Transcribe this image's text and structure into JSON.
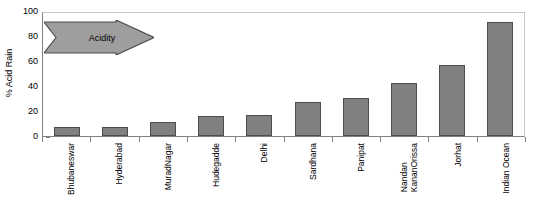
{
  "chart_data": {
    "type": "bar",
    "title": "",
    "xlabel": "",
    "ylabel": "% Acid Rain",
    "ylim": [
      0,
      100
    ],
    "yticks": [
      0,
      20,
      40,
      60,
      80,
      100
    ],
    "grid": false,
    "legend": null,
    "bar_color": "#808080",
    "bar_border_color": "#4d4d4d",
    "categories": [
      "Bhubaneswar",
      "Hyderabad",
      "MuradNagar",
      "Hudegadde",
      "Delhi",
      "Sardhana",
      "Panipat",
      "Nandan KananOrissa",
      "Jorhat",
      "Indian Ocean"
    ],
    "category_lines": [
      [
        "Bhubaneswar"
      ],
      [
        "Hyderabad"
      ],
      [
        "MuradNagar"
      ],
      [
        "Hudegadde"
      ],
      [
        "Delhi"
      ],
      [
        "Sardhana"
      ],
      [
        "Panipat"
      ],
      [
        "Nandan",
        "KananOrissa"
      ],
      [
        "Jorhat"
      ],
      [
        "Indian Ocean"
      ]
    ],
    "values": [
      7,
      7,
      11,
      16,
      17,
      28,
      31,
      43,
      58,
      93
    ]
  },
  "annotation": {
    "arrow_label": "Acidity",
    "arrow_direction": "right",
    "arrow_fill": "#9e9e9e",
    "arrow_border": "#4d4d4d"
  }
}
